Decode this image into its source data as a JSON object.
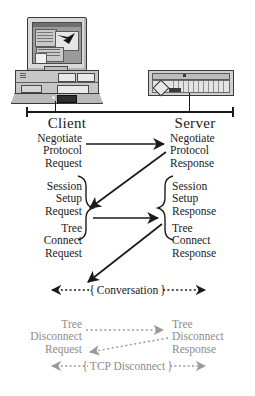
{
  "diagram": {
    "colors": {
      "ink": "#1a1a1a",
      "dimmed": "#8c8c8c",
      "device_body": "#c6c6c6",
      "screen": "#9a9a9a"
    }
  },
  "endpoints": {
    "client": {
      "label": "Client",
      "icon": "desktop-computer-icon"
    },
    "server": {
      "label": "Server",
      "icon": "rack-server-icon"
    }
  },
  "messages": [
    {
      "id": "negotiate-protocol-request",
      "side": "client",
      "lines": [
        "Negotiate",
        "Protocol",
        "Request"
      ]
    },
    {
      "id": "negotiate-protocol-response",
      "side": "server",
      "lines": [
        "Negotiate",
        "Protocol",
        "Response"
      ]
    },
    {
      "id": "session-setup-request",
      "side": "client",
      "lines": [
        "Session",
        "Setup",
        "Request"
      ]
    },
    {
      "id": "session-setup-response",
      "side": "server",
      "lines": [
        "Session",
        "Setup",
        "Response"
      ]
    },
    {
      "id": "tree-connect-request",
      "side": "client",
      "lines": [
        "Tree",
        "Connect",
        "Request"
      ]
    },
    {
      "id": "tree-connect-response",
      "side": "server",
      "lines": [
        "Tree",
        "Connect",
        "Response"
      ]
    },
    {
      "id": "tree-disconnect-request",
      "side": "client",
      "lines": [
        "Tree",
        "Disconnect",
        "Request"
      ]
    },
    {
      "id": "tree-disconnect-response",
      "side": "server",
      "lines": [
        "Tree",
        "Disconnect",
        "Response"
      ]
    }
  ],
  "phases": {
    "conversation": {
      "open_brace": "{",
      "label": "Conversation",
      "close_brace": "}"
    },
    "tcp_disconnect": {
      "open_brace": "{",
      "label": "TCP Disconnect",
      "close_brace": "}"
    }
  },
  "arrows": [
    {
      "id": "negotiate-request-arrow",
      "from": "client",
      "to": "server",
      "style": "solid"
    },
    {
      "id": "negotiate-response-arrow",
      "from": "server",
      "to": "client",
      "style": "solid"
    },
    {
      "id": "session-setup-request-arrow",
      "from": "client",
      "to": "server",
      "style": "solid"
    },
    {
      "id": "session-setup-response-arrow",
      "from": "server",
      "to": "client",
      "style": "solid"
    },
    {
      "id": "tree-disconnect-request-arrow",
      "from": "client",
      "to": "server",
      "style": "dotted"
    },
    {
      "id": "tree-disconnect-response-arrow",
      "from": "server",
      "to": "client",
      "style": "dotted"
    }
  ]
}
